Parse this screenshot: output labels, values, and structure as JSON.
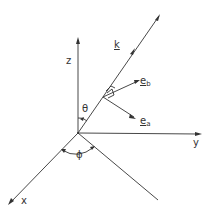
{
  "figure": {
    "labels": {
      "z_axis": "z",
      "y_axis": "y",
      "x_axis": "x",
      "k_vector": "k",
      "theta": "θ",
      "phi": "ϕ",
      "e_b_main": "e",
      "e_b_sub": "b",
      "e_a_main": "e",
      "e_a_sub": "a"
    },
    "colors": {
      "line": "#333333",
      "background": "#ffffff"
    }
  }
}
